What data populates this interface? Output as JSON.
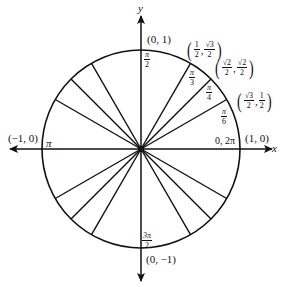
{
  "diagram": {
    "axes": {
      "x_label": "x",
      "y_label": "y"
    },
    "points": {
      "top": "(0, 1)",
      "bottom": "(0, −1)",
      "left": "(−1, 0)",
      "right": "(1, 0)"
    },
    "angles": {
      "right": "0, 2π",
      "left": "π",
      "top": {
        "num": "π",
        "den": "2"
      },
      "bottom": {
        "num": "3π",
        "den": "2"
      },
      "pi_3": {
        "num": "π",
        "den": "3"
      },
      "pi_4": {
        "num": "π",
        "den": "4"
      },
      "pi_6": {
        "num": "π",
        "den": "6"
      }
    },
    "coordinates": {
      "pi_3": {
        "x_num": "1",
        "x_den": "2",
        "y_num": "√3",
        "y_den": "2",
        "comma": ","
      },
      "pi_4": {
        "x_num": "√2",
        "x_den": "2",
        "y_num": "√2",
        "y_den": "2",
        "comma": ","
      },
      "pi_6": {
        "x_num": "√3",
        "x_den": "2",
        "y_num": "1",
        "y_den": "2",
        "comma": ","
      }
    },
    "paren_open": "(",
    "paren_close": ")",
    "radial_lines_degrees": [
      30,
      45,
      60,
      120,
      135,
      150,
      210,
      225,
      240,
      300,
      315,
      330
    ],
    "line_color": "#111111"
  }
}
